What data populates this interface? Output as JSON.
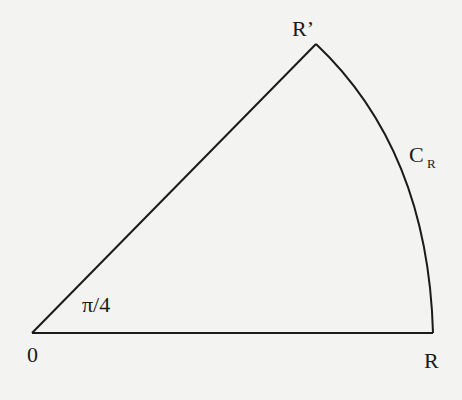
{
  "diagram": {
    "type": "contour-sector",
    "stroke_color": "#1a1a1a",
    "background": "#f3f3f1",
    "labels": {
      "origin": "0",
      "endpoint_real": "R",
      "endpoint_apex": "R’",
      "arc_main": "C",
      "arc_sub": "R",
      "angle": "π/4"
    },
    "points": {
      "origin": [
        32,
        333
      ],
      "R": [
        433,
        333
      ],
      "R_prime": [
        316,
        44
      ]
    }
  }
}
